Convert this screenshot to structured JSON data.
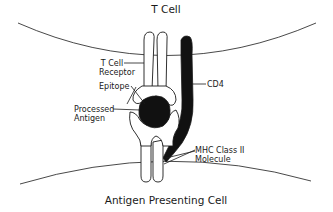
{
  "diagram": {
    "top_cell_label": "T Cell",
    "bottom_cell_label": "Antigen Presenting Cell",
    "labels": {
      "tcr_line1": "T Cell",
      "tcr_line2": "Receptor",
      "epitope": "Epitope",
      "antigen_line1": "Processed",
      "antigen_line2": "Antigen",
      "cd4": "CD4",
      "mhc_line1": "MHC Class II",
      "mhc_line2": "Molecule"
    },
    "colors": {
      "line": "#1a1a1a",
      "fill_dark": "#111111",
      "fill_light": "#ffffff"
    }
  }
}
